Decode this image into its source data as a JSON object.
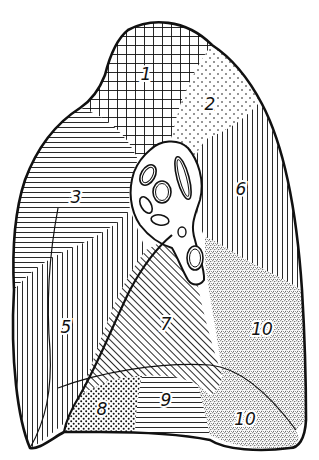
{
  "diagram": {
    "outline_color": "#111111",
    "background": "#ffffff",
    "segments": [
      {
        "id": "1",
        "label": "1",
        "pattern": "grid-crosshatch",
        "x": 146,
        "y": 80
      },
      {
        "id": "2",
        "label": "2",
        "pattern": "sparse-dots",
        "x": 210,
        "y": 110
      },
      {
        "id": "3",
        "label": "3",
        "pattern": "horizontal-lines",
        "x": 76,
        "y": 203
      },
      {
        "id": "5",
        "label": "5",
        "pattern": "vertical-lines",
        "x": 66,
        "y": 333
      },
      {
        "id": "6",
        "label": "6",
        "pattern": "vertical-lines",
        "x": 241,
        "y": 195
      },
      {
        "id": "7",
        "label": "7",
        "pattern": "diagonal-lines",
        "x": 166,
        "y": 330
      },
      {
        "id": "8",
        "label": "8",
        "pattern": "dense-dots",
        "x": 102,
        "y": 415
      },
      {
        "id": "9",
        "label": "9",
        "pattern": "horizontal-lines",
        "x": 166,
        "y": 406
      },
      {
        "id": "10a",
        "label": "10",
        "pattern": "fine-stipple",
        "x": 262,
        "y": 335
      },
      {
        "id": "10b",
        "label": "10",
        "pattern": "fine-stipple",
        "x": 245,
        "y": 425
      }
    ]
  }
}
